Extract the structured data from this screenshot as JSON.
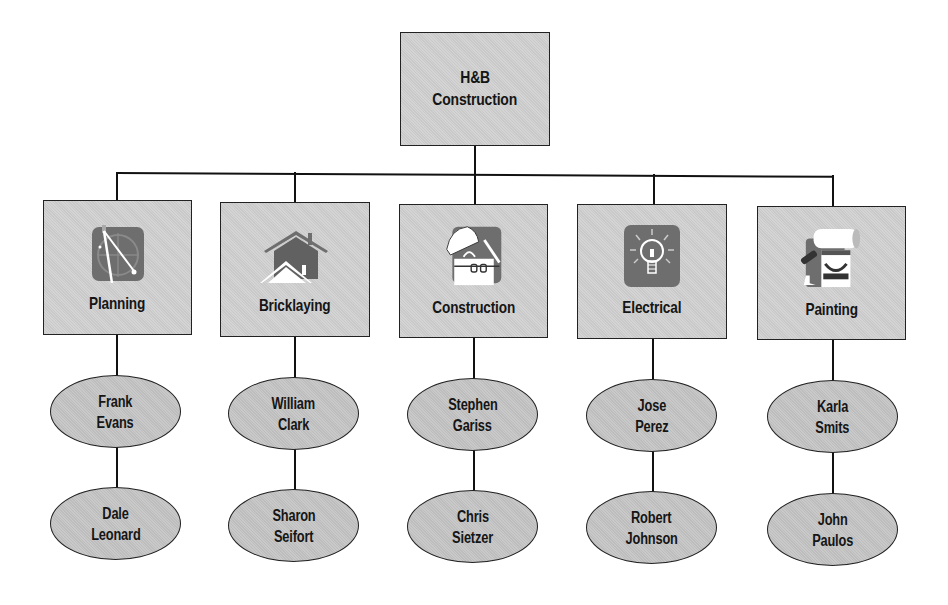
{
  "root": {
    "line1": "H&B",
    "line2": "Construction"
  },
  "departments": [
    {
      "name": "Planning",
      "icon": "compass-blueprint-icon",
      "staff": [
        {
          "first": "Frank",
          "last": "Evans"
        },
        {
          "first": "Dale",
          "last": "Leonard"
        }
      ]
    },
    {
      "name": "Bricklaying",
      "icon": "house-icon",
      "staff": [
        {
          "first": "William",
          "last": "Clark"
        },
        {
          "first": "Sharon",
          "last": "Seifort"
        }
      ]
    },
    {
      "name": "Construction",
      "icon": "hard-hat-worker-icon",
      "staff": [
        {
          "first": "Stephen",
          "last": "Gariss"
        },
        {
          "first": "Chris",
          "last": "Sietzer"
        }
      ]
    },
    {
      "name": "Electrical",
      "icon": "light-bulb-icon",
      "staff": [
        {
          "first": "Jose",
          "last": "Perez"
        },
        {
          "first": "Robert",
          "last": "Johnson"
        }
      ]
    },
    {
      "name": "Painting",
      "icon": "paint-roller-icon",
      "staff": [
        {
          "first": "Karla",
          "last": "Smits"
        },
        {
          "first": "John",
          "last": "Paulos"
        }
      ]
    }
  ],
  "colors": {
    "box_fill": "#cfcfcf",
    "ellipse_fill": "#c3c3c3",
    "line": "#111111",
    "icon_bg": "#6e6e6e"
  }
}
